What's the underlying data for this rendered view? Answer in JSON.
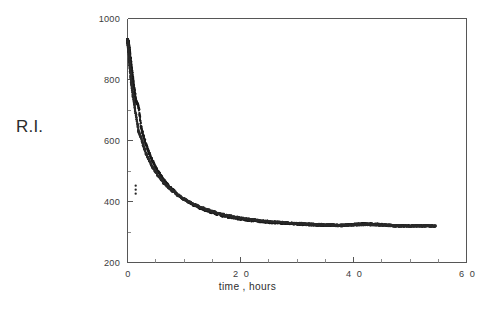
{
  "figure": {
    "background_color": "#ffffff",
    "ink_color": "#1b1b1b",
    "axis_color": "#565656"
  },
  "axis_titles": {
    "x": "time , hours",
    "y": "R.I."
  },
  "chart_data": {
    "type": "scatter",
    "title": "",
    "subtitle": "",
    "xlabel": "time , hours",
    "ylabel": "R.I.",
    "xlim": [
      0,
      60
    ],
    "ylim": [
      200,
      1000
    ],
    "grid": false,
    "legend": null,
    "legend_position": "none",
    "xticks": [
      0,
      20,
      40,
      60
    ],
    "xtick_labels": [
      "0",
      "2 0",
      "4 0",
      "6 0"
    ],
    "yticks": [
      200,
      400,
      600,
      800,
      1000
    ],
    "ytick_labels": [
      "200",
      "400",
      "600",
      "800",
      "1000"
    ],
    "x_minor_tick_step": 5,
    "y_minor_tick_step": 100,
    "annotations": [
      {
        "label": "bump / loop artifact",
        "x": 1.9,
        "y": 390
      },
      {
        "label": "isolated stray point",
        "x": 1.45,
        "y": 452
      }
    ],
    "series": [
      {
        "name": "run-1",
        "marker": "dot",
        "color": "#1b1b1b",
        "description": "Refractive index decay, dense upper trace",
        "x": [
          0.0,
          0.05,
          0.1,
          0.15,
          0.2,
          0.25,
          0.3,
          0.35,
          0.4,
          0.45,
          0.5,
          0.6,
          0.7,
          0.8,
          0.9,
          1.0,
          1.1,
          1.2,
          1.3,
          1.4,
          1.5,
          1.65,
          1.8,
          1.9,
          2.0,
          2.2,
          2.4,
          2.6,
          2.8,
          3.0,
          3.3,
          3.6,
          3.9,
          4.2,
          4.5,
          5.0,
          5.5,
          6.0,
          6.5,
          7.0,
          7.5,
          8.0,
          9.0,
          10.0,
          11.0,
          12.0,
          13.0,
          14.0,
          15.0,
          16.0,
          17.0,
          18.0,
          19.0,
          20.0,
          22.0,
          24.0,
          26.0,
          28.0,
          30.0,
          32.0,
          34.0,
          36.0,
          38.0,
          40.0,
          42.0,
          44.0,
          46.0,
          48.0,
          50.0,
          52.0,
          54.5
        ],
        "y": [
          930,
          928,
          925,
          921,
          916,
          910,
          903,
          896,
          888,
          880,
          872,
          856,
          840,
          825,
          810,
          796,
          782,
          769,
          756,
          744,
          732,
          714,
          698,
          688,
          679,
          661,
          645,
          630,
          616,
          603,
          586,
          570,
          556,
          543,
          531,
          512,
          496,
          482,
          469,
          458,
          447,
          438,
          421,
          407,
          396,
          386,
          377,
          370,
          364,
          358,
          353,
          349,
          345,
          342,
          337,
          333,
          330,
          328,
          326,
          324,
          323,
          322,
          321,
          321,
          321,
          320,
          320,
          320,
          320,
          320,
          320
        ]
      },
      {
        "name": "run-2",
        "marker": "dot",
        "color": "#2a2a2a",
        "description": "Refractive index decay, scattered lower/offset trace",
        "x": [
          0.0,
          0.05,
          0.1,
          0.15,
          0.2,
          0.25,
          0.3,
          0.35,
          0.4,
          0.45,
          0.5,
          0.6,
          0.7,
          0.8,
          0.9,
          1.0,
          1.1,
          1.2,
          1.3,
          1.4,
          1.5,
          1.65,
          1.8,
          1.9,
          2.0,
          2.2,
          2.4,
          2.6,
          2.8,
          3.0,
          3.3,
          3.6,
          3.9,
          4.2,
          4.5,
          5.0,
          5.5,
          6.0,
          6.5,
          7.0,
          7.5,
          8.0,
          9.0,
          10.0,
          11.0,
          12.0,
          13.0,
          14.0,
          15.0,
          16.0,
          17.0,
          18.0,
          19.0,
          20.0,
          22.0,
          24.0,
          26.0,
          28.0,
          30.0,
          32.0,
          34.0,
          36.0,
          38.0,
          40.0,
          42.0,
          44.0,
          46.0,
          48.0,
          50.0,
          52.0,
          54.5
        ],
        "y": [
          928,
          921,
          912,
          902,
          891,
          879,
          867,
          856,
          845,
          834,
          824,
          805,
          788,
          772,
          757,
          743,
          730,
          717,
          705,
          694,
          683,
          668,
          654,
          645,
          637,
          622,
          608,
          595,
          583,
          572,
          557,
          544,
          532,
          521,
          511,
          496,
          483,
          471,
          460,
          451,
          442,
          434,
          420,
          408,
          398,
          389,
          381,
          374,
          368,
          362,
          357,
          353,
          349,
          346,
          341,
          337,
          334,
          331,
          328,
          326,
          324,
          323,
          322,
          321,
          322,
          321,
          321,
          320,
          320,
          320,
          320
        ]
      }
    ]
  }
}
